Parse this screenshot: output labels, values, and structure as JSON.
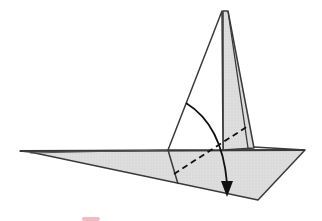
{
  "diagram": {
    "type": "origami-fold-step",
    "colors": {
      "background": "#ffffff",
      "paper_shaded": "#dcdcdc",
      "paper_white": "#ffffff",
      "outline": "#3a3a3a",
      "arrow": "#111111",
      "mark": "#e8a0a8"
    },
    "elements": {
      "base_flap": "shaded base flap pointing left",
      "tall_flap": "upright triangular flap",
      "valley_fold_line": "dashed fold line",
      "fold_arrow": "curved arrow indicating fold down"
    }
  }
}
